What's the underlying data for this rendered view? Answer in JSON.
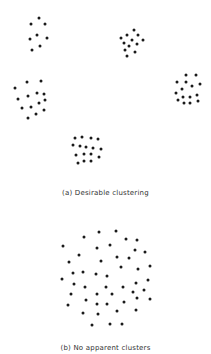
{
  "figure": {
    "panels": [
      {
        "id": "a",
        "caption": "(a) Desirable clustering",
        "caption_y": 194,
        "clusters": [
          {
            "name": "cluster-top-left",
            "points": [
              [
                39,
                18
              ],
              [
                31,
                24
              ],
              [
                45,
                24
              ],
              [
                37,
                35
              ],
              [
                30,
                39
              ],
              [
                47,
                38
              ],
              [
                40,
                46
              ],
              [
                32,
                50
              ]
            ]
          },
          {
            "name": "cluster-top-right",
            "points": [
              [
                134,
                30
              ],
              [
                127,
                35
              ],
              [
                138,
                35
              ],
              [
                121,
                38
              ],
              [
                132,
                40
              ],
              [
                143,
                40
              ],
              [
                124,
                43
              ],
              [
                129,
                46
              ],
              [
                137,
                44
              ],
              [
                125,
                50
              ],
              [
                135,
                52
              ],
              [
                127,
                56
              ]
            ]
          },
          {
            "name": "cluster-mid-left",
            "points": [
              [
                41,
                81
              ],
              [
                27,
                82
              ],
              [
                15,
                88
              ],
              [
                37,
                93
              ],
              [
                44,
                94
              ],
              [
                28,
                96
              ],
              [
                18,
                99
              ],
              [
                45,
                100
              ],
              [
                39,
                103
              ],
              [
                31,
                107
              ],
              [
                22,
                108
              ],
              [
                44,
                110
              ],
              [
                36,
                114
              ],
              [
                28,
                118
              ]
            ]
          },
          {
            "name": "cluster-mid-right",
            "points": [
              [
                186,
                75
              ],
              [
                196,
                75
              ],
              [
                177,
                82
              ],
              [
                186,
                82
              ],
              [
                200,
                84
              ],
              [
                192,
                86
              ],
              [
                182,
                89
              ],
              [
                176,
                93
              ],
              [
                183,
                97
              ],
              [
                190,
                97
              ],
              [
                197,
                95
              ],
              [
                178,
                100
              ],
              [
                184,
                103
              ],
              [
                190,
                103
              ],
              [
                198,
                101
              ]
            ]
          },
          {
            "name": "cluster-bottom",
            "points": [
              [
                75,
                138
              ],
              [
                82,
                137
              ],
              [
                91,
                138
              ],
              [
                98,
                139
              ],
              [
                73,
                145
              ],
              [
                80,
                146
              ],
              [
                86,
                147
              ],
              [
                93,
                148
              ],
              [
                101,
                149
              ],
              [
                76,
                155
              ],
              [
                84,
                154
              ],
              [
                91,
                154
              ],
              [
                99,
                157
              ],
              [
                78,
                163
              ],
              [
                84,
                161
              ],
              [
                91,
                161
              ]
            ]
          }
        ]
      },
      {
        "id": "b",
        "caption": "(b) No apparent clusters",
        "caption_y": 350,
        "clusters": [
          {
            "name": "scattered-points",
            "points": [
              [
                84,
                237
              ],
              [
                99,
                232
              ],
              [
                116,
                231
              ],
              [
                63,
                246
              ],
              [
                97,
                248
              ],
              [
                110,
                245
              ],
              [
                126,
                239
              ],
              [
                137,
                240
              ],
              [
                79,
                255
              ],
              [
                135,
                250
              ],
              [
                145,
                252
              ],
              [
                69,
                262
              ],
              [
                101,
                261
              ],
              [
                117,
                257
              ],
              [
                129,
                258
              ],
              [
                121,
                267
              ],
              [
                138,
                269
              ],
              [
                150,
                266
              ],
              [
                73,
                273
              ],
              [
                83,
                272
              ],
              [
                96,
                274
              ],
              [
                107,
                276
              ],
              [
                62,
                279
              ],
              [
                74,
                284
              ],
              [
                85,
                287
              ],
              [
                106,
                287
              ],
              [
                123,
                287
              ],
              [
                136,
                283
              ],
              [
                148,
                280
              ],
              [
                71,
                294
              ],
              [
                97,
                294
              ],
              [
                112,
                294
              ],
              [
                133,
                292
              ],
              [
                144,
                290
              ],
              [
                86,
                300
              ],
              [
                137,
                298
              ],
              [
                150,
                299
              ],
              [
                68,
                305
              ],
              [
                97,
                304
              ],
              [
                107,
                304
              ],
              [
                124,
                302
              ],
              [
                83,
                313
              ],
              [
                98,
                314
              ],
              [
                117,
                311
              ],
              [
                136,
                310
              ],
              [
                92,
                325
              ],
              [
                110,
                324
              ],
              [
                122,
                324
              ]
            ]
          }
        ]
      }
    ],
    "dot_color": "#1a1a1a",
    "caption_color": "#333333"
  }
}
